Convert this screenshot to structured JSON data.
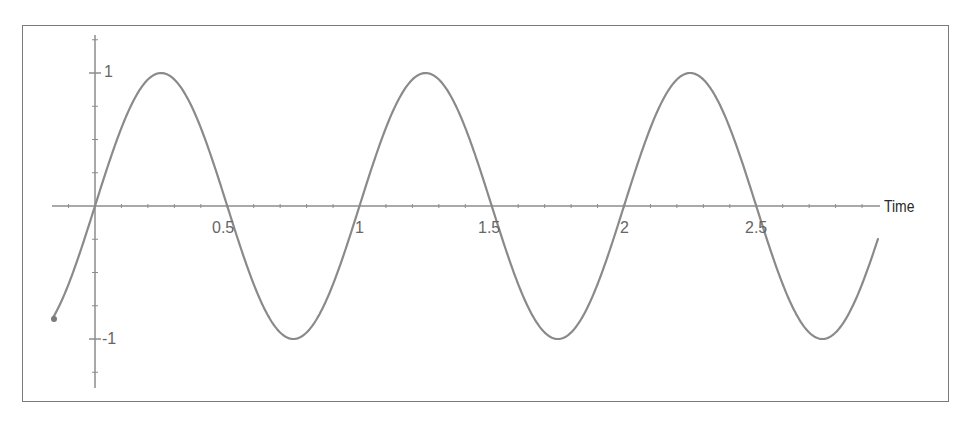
{
  "chart_data": {
    "type": "line",
    "title": "",
    "xlabel": "Time",
    "ylabel": "",
    "function": "sin(2*pi*t)",
    "x_range_plotted": [
      -0.16,
      2.96
    ],
    "xlim": [
      -0.16,
      2.96
    ],
    "ylim": [
      -1.25,
      1.3
    ],
    "x_ticks": [
      0.5,
      1,
      1.5,
      2,
      2.5
    ],
    "x_tick_labels": [
      "0.5",
      "1",
      "1.5",
      "2",
      "2.5"
    ],
    "y_ticks": [
      1,
      -1
    ],
    "y_tick_labels": [
      "1",
      "-1"
    ],
    "grid": false,
    "legend": null,
    "series": [
      {
        "name": "sine wave",
        "color": "#8a8a8a",
        "x": [
          -0.16,
          0,
          0.25,
          0.5,
          0.75,
          1,
          1.25,
          1.5,
          1.75,
          2,
          2.25,
          2.5,
          2.75,
          2.96
        ],
        "values": [
          -0.84,
          0,
          1,
          0,
          -1,
          0,
          1,
          0,
          -1,
          0,
          1,
          0,
          -1,
          -0.48
        ]
      }
    ],
    "features": {
      "peaks_at": [
        0.25,
        1.25,
        2.25
      ],
      "troughs_at": [
        0.75,
        1.75,
        2.75
      ],
      "zero_crossings": [
        0,
        0.5,
        1,
        1.5,
        2,
        2.5
      ],
      "period": 1,
      "amplitude": 1
    }
  },
  "colors": {
    "axis": "#8c8c8c",
    "curve": "#8a8a8a",
    "frame": "#7a7a7a",
    "tick_text": "#666666",
    "axis_title_text": "#2a2a2a"
  }
}
